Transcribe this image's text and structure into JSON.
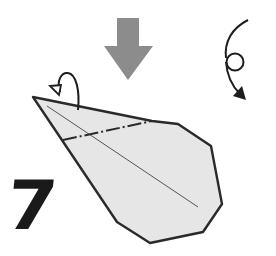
{
  "diagram": {
    "type": "origami-step",
    "step_number": "7",
    "colors": {
      "paper_fill": "#e6e6e6",
      "outline": "#2a2a2a",
      "push_arrow": "#8c8c8c",
      "background": "#ffffff"
    },
    "symbols": [
      {
        "name": "push-arrow",
        "meaning": "push / squash down"
      },
      {
        "name": "turn-over-arrow",
        "meaning": "turn model over"
      },
      {
        "name": "mountain-fold-arrow",
        "meaning": "fold behind"
      },
      {
        "name": "mountain-fold-line",
        "meaning": "dash-dot mountain fold"
      },
      {
        "name": "center-crease",
        "meaning": "existing crease"
      }
    ]
  }
}
